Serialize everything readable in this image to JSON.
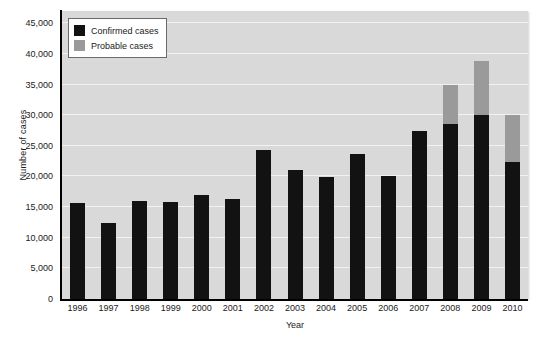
{
  "chart_data": {
    "type": "bar",
    "subtype": "stacked",
    "title": "",
    "xlabel": "Year",
    "ylabel": "Number of cases",
    "categories": [
      "1996",
      "1997",
      "1998",
      "1999",
      "2000",
      "2001",
      "2002",
      "2003",
      "2004",
      "2005",
      "2006",
      "2007",
      "2008",
      "2009",
      "2010"
    ],
    "series": [
      {
        "name": "Confirmed cases",
        "color": "#121212",
        "values": [
          15700,
          12400,
          16000,
          15900,
          16900,
          16400,
          24300,
          21100,
          19900,
          23700,
          20000,
          27500,
          28500,
          30000,
          22300
        ]
      },
      {
        "name": "Probable cases",
        "color": "#9a9a9a",
        "values": [
          0,
          0,
          0,
          0,
          0,
          0,
          0,
          0,
          0,
          0,
          0,
          0,
          6500,
          8800,
          7700
        ]
      }
    ],
    "totals": [
      15700,
      12400,
      16000,
      15900,
      16900,
      16400,
      24300,
      21100,
      19900,
      23700,
      20000,
      27500,
      35000,
      38800,
      30000
    ],
    "ylim": [
      0,
      47000
    ],
    "yticks": [
      0,
      5000,
      10000,
      15000,
      20000,
      25000,
      30000,
      35000,
      40000,
      45000
    ],
    "ytick_labels": [
      "0",
      "5,000",
      "10,000",
      "15,000",
      "20,000",
      "25,000",
      "30,000",
      "35,000",
      "40,000",
      "45,000"
    ],
    "grid": true,
    "grid_color": "#f2f2f2",
    "plot_background": "#d9d9d9",
    "legend_position": "top-left",
    "legend": [
      {
        "label": "Confirmed cases",
        "color": "#121212"
      },
      {
        "label": "Probable cases",
        "color": "#9a9a9a"
      }
    ]
  }
}
